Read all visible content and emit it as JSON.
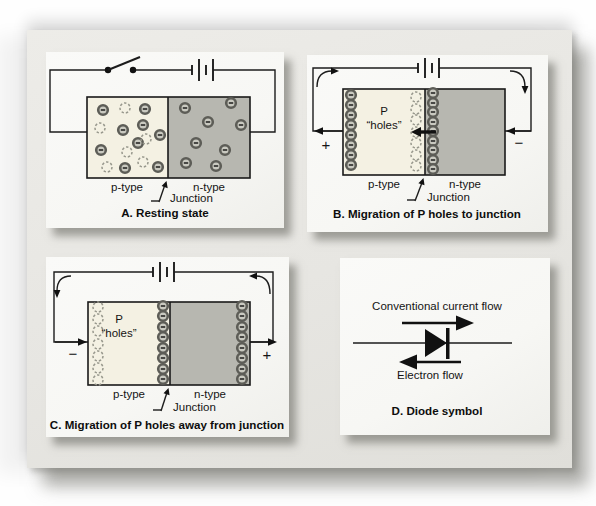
{
  "panels": {
    "a": {
      "caption": "A. Resting state",
      "p_label": "p-type",
      "n_label": "n-type",
      "junction_label": "Junction",
      "p_electrons": [
        [
          57,
          58
        ],
        [
          99,
          57
        ],
        [
          77,
          78
        ],
        [
          97,
          73
        ],
        [
          114,
          83
        ],
        [
          55,
          98
        ],
        [
          92,
          91
        ],
        [
          79,
          116
        ],
        [
          112,
          115
        ]
      ],
      "p_holes": [
        [
          79,
          56
        ],
        [
          54,
          76
        ],
        [
          100,
          87
        ],
        [
          81,
          100
        ],
        [
          61,
          115
        ],
        [
          97,
          110
        ]
      ],
      "n_electrons": [
        [
          139,
          56
        ],
        [
          185,
          51
        ],
        [
          162,
          70
        ],
        [
          195,
          73
        ],
        [
          150,
          91
        ],
        [
          179,
          98
        ],
        [
          140,
          111
        ],
        [
          170,
          114
        ]
      ]
    },
    "b": {
      "caption": "B. Migration of P holes to junction",
      "p_label": "p-type",
      "n_label": "n-type",
      "junction_label": "Junction",
      "region_label_line1": "P",
      "region_label_line2": "“holes”",
      "plus": "+",
      "minus": "−",
      "left_electrons": [
        [
          44,
          40
        ],
        [
          44,
          50
        ],
        [
          44,
          60
        ],
        [
          44,
          70
        ],
        [
          44,
          80
        ],
        [
          44,
          90
        ],
        [
          44,
          100
        ],
        [
          44,
          110
        ]
      ],
      "junction_holes": [
        [
          109,
          42
        ],
        [
          109,
          54
        ],
        [
          109,
          65
        ],
        [
          109,
          77
        ],
        [
          109,
          88
        ],
        [
          109,
          100
        ],
        [
          109,
          111
        ]
      ],
      "junction_electrons": [
        [
          126,
          38
        ],
        [
          126,
          48
        ],
        [
          126,
          57
        ],
        [
          126,
          67
        ],
        [
          126,
          76
        ],
        [
          126,
          86
        ],
        [
          126,
          95
        ],
        [
          126,
          105
        ],
        [
          126,
          114
        ]
      ]
    },
    "c": {
      "caption": "C. Migration of P holes away from junction",
      "p_label": "p-type",
      "n_label": "n-type",
      "junction_label": "Junction",
      "region_label_line1": "P",
      "region_label_line2": "“holes”",
      "minus": "−",
      "plus": "+",
      "left_holes": [
        [
          52,
          50
        ],
        [
          52,
          62
        ],
        [
          52,
          74
        ],
        [
          52,
          87
        ],
        [
          52,
          99
        ],
        [
          52,
          111
        ],
        [
          52,
          123
        ]
      ],
      "junction_electrons": [
        [
          117,
          49
        ],
        [
          117,
          59
        ],
        [
          117,
          70
        ],
        [
          117,
          80
        ],
        [
          117,
          91
        ],
        [
          117,
          101
        ],
        [
          117,
          112
        ],
        [
          117,
          122
        ]
      ],
      "right_electrons": [
        [
          196,
          49
        ],
        [
          196,
          59
        ],
        [
          196,
          70
        ],
        [
          196,
          80
        ],
        [
          196,
          91
        ],
        [
          196,
          101
        ],
        [
          196,
          112
        ],
        [
          196,
          122
        ]
      ]
    },
    "d": {
      "caption": "D. Diode symbol",
      "current_label": "Conventional current flow",
      "electron_label": "Electron flow"
    }
  },
  "colors": {
    "p_region": "#f4f1e3",
    "n_region": "#b7b7b0",
    "electron_ring": "#5d5d57",
    "electron_fill": "#c9c9c0",
    "hole_outline": "#97978c",
    "wire": "#1c1c1c",
    "card": "#f7f7f4",
    "paper": "#e7e6e2"
  }
}
